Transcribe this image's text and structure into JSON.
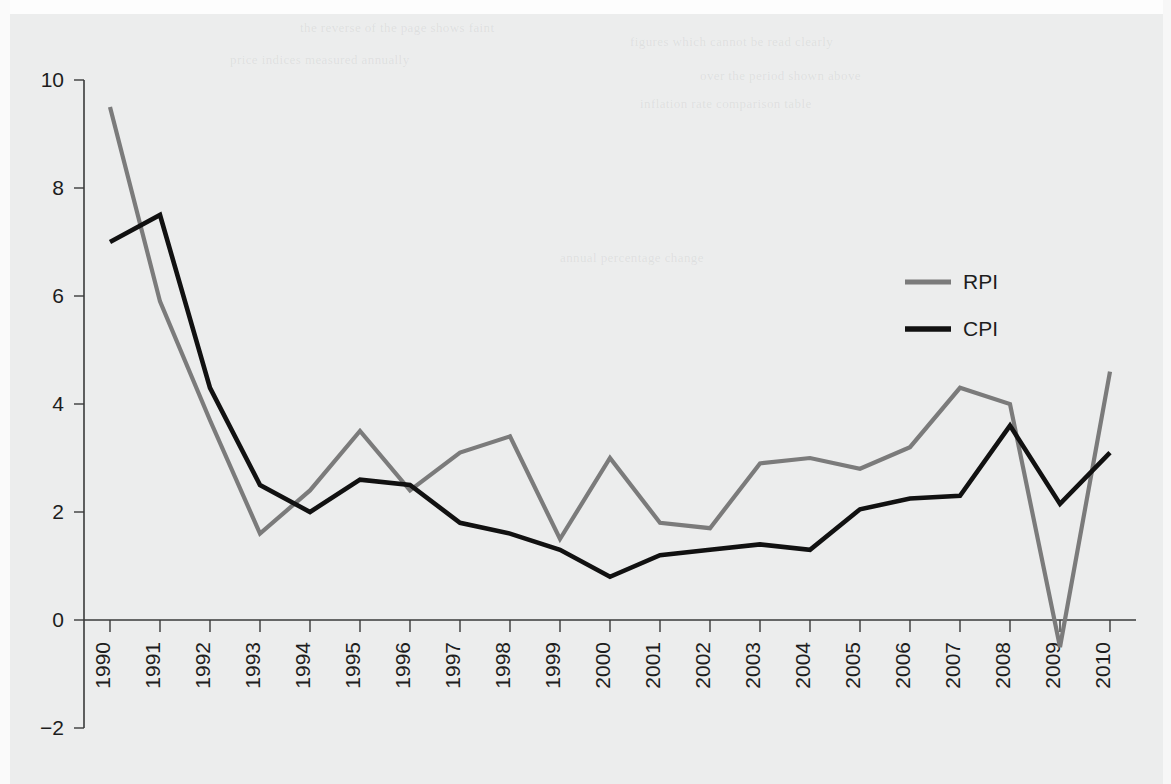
{
  "chart_data": {
    "type": "line",
    "title": "",
    "xlabel": "",
    "ylabel": "",
    "x": [
      1990,
      1991,
      1992,
      1993,
      1994,
      1995,
      1996,
      1997,
      1998,
      1999,
      2000,
      2001,
      2002,
      2003,
      2004,
      2005,
      2006,
      2007,
      2008,
      2009,
      2010
    ],
    "categories": [
      "1990",
      "1991",
      "1992",
      "1993",
      "1994",
      "1995",
      "1996",
      "1997",
      "1998",
      "1999",
      "2000",
      "2001",
      "2002",
      "2003",
      "2004",
      "2005",
      "2006",
      "2007",
      "2008",
      "2009",
      "2010"
    ],
    "series": [
      {
        "name": "RPI",
        "color": "#7b7b7b",
        "values": [
          9.5,
          5.9,
          3.7,
          1.6,
          2.4,
          3.5,
          2.4,
          3.1,
          3.4,
          1.5,
          3.0,
          1.8,
          1.7,
          2.9,
          3.0,
          2.8,
          3.2,
          4.3,
          4.0,
          -0.5,
          4.6
        ]
      },
      {
        "name": "CPI",
        "color": "#111111",
        "values": [
          7.0,
          7.5,
          4.3,
          2.5,
          2.0,
          2.6,
          2.5,
          1.8,
          1.6,
          1.3,
          0.8,
          1.2,
          1.3,
          1.4,
          1.3,
          2.05,
          2.25,
          2.3,
          3.6,
          2.15,
          3.1
        ]
      }
    ],
    "ylim": [
      -2,
      10
    ],
    "yticks": [
      -2,
      0,
      2,
      4,
      6,
      8,
      10
    ],
    "ytick_labels": [
      "−2",
      "0",
      "2",
      "4",
      "6",
      "8",
      "10"
    ],
    "grid": false,
    "legend_position": "upper-right",
    "legend_entries": [
      "RPI",
      "CPI"
    ],
    "xtick_label_rotation": -90,
    "axis_color": "#3a3a3a",
    "background_color": "#eceded"
  },
  "bleed_text": [
    {
      "text": "the reverse of the page shows faint",
      "x": 300,
      "y": 20
    },
    {
      "text": "figures which cannot be read clearly",
      "x": 630,
      "y": 34
    },
    {
      "text": "price indices measured annually",
      "x": 230,
      "y": 52
    },
    {
      "text": "over the period shown above",
      "x": 700,
      "y": 68
    },
    {
      "text": "inflation rate comparison table",
      "x": 640,
      "y": 96
    },
    {
      "text": "annual percentage change",
      "x": 560,
      "y": 250
    }
  ]
}
